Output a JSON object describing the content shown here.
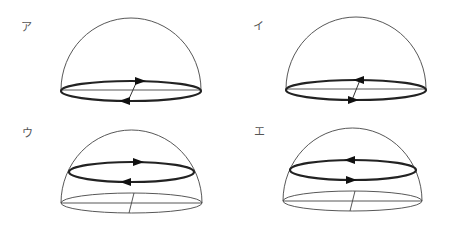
{
  "figure": {
    "panels": [
      {
        "id": "a",
        "label": "ア",
        "description": "Hemisphere with bold current loop on base circle; back arrow points right, front arrow points left",
        "loop_position": "base",
        "back_arrow": "right",
        "front_arrow": "left"
      },
      {
        "id": "i",
        "label": "イ",
        "description": "Hemisphere with bold current loop on base circle; back arrow points left, front arrow points right",
        "loop_position": "base",
        "back_arrow": "left",
        "front_arrow": "right"
      },
      {
        "id": "u",
        "label": "ウ",
        "description": "Hemisphere with bold current loop at mid-height; back arrow points right, front arrow points left",
        "loop_position": "upper",
        "back_arrow": "right",
        "front_arrow": "left"
      },
      {
        "id": "e",
        "label": "エ",
        "description": "Hemisphere with bold current loop at mid-height; back arrow points left, front arrow points right",
        "loop_position": "upper",
        "back_arrow": "left",
        "front_arrow": "right"
      }
    ],
    "colors": {
      "background": "#ffffff",
      "line": "#444444",
      "bold_line": "#222222",
      "arrowhead": "#111111",
      "label": "#555555"
    }
  }
}
